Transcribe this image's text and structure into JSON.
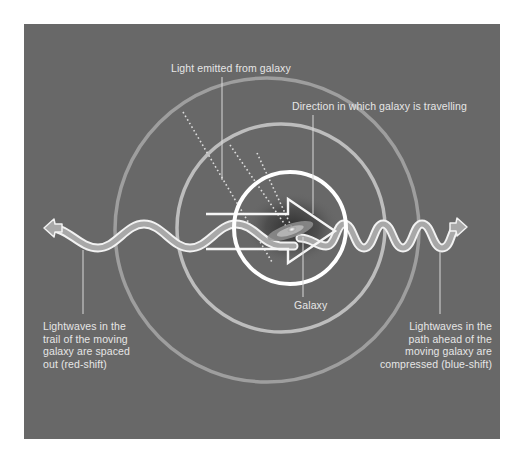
{
  "colors": {
    "page_background": "#ffffff",
    "panel_background": "#686868",
    "label_text": "#e6e6e6",
    "inner_circle": "#ffffff",
    "middle_circle": "#bdbdbd",
    "outer_circle": "#9e9e9e",
    "wave_fill": "#a8a8a8",
    "wave_outline": "#f2f2f2",
    "leader_line": "#d8d8d8"
  },
  "labels": {
    "light_emitted": "Light emitted from galaxy",
    "direction": "Direction in which galaxy is travelling",
    "galaxy": "Galaxy",
    "red_shift": "Lightwaves in the\ntrail of the moving\ngalaxy are spaced\nout (red-shift)",
    "blue_shift": "Lightwaves in the\npath ahead of the\nmoving galaxy are\ncompressed (blue-shift)"
  },
  "diagram": {
    "circles": [
      {
        "name": "outer-wavefront",
        "cx": 267,
        "cy": 230,
        "r": 152
      },
      {
        "name": "middle-wavefront",
        "cx": 281,
        "cy": 228,
        "r": 104
      },
      {
        "name": "inner-wavefront",
        "cx": 290,
        "cy": 228,
        "r": 56
      }
    ],
    "wave_left": {
      "start_x": 48,
      "end_x": 290,
      "wavelength": 62,
      "amplitude": 12,
      "center_y": 236
    },
    "wave_right": {
      "start_x": 290,
      "end_x": 460,
      "wavelength": 39,
      "amplitude": 11,
      "center_y": 236
    }
  }
}
